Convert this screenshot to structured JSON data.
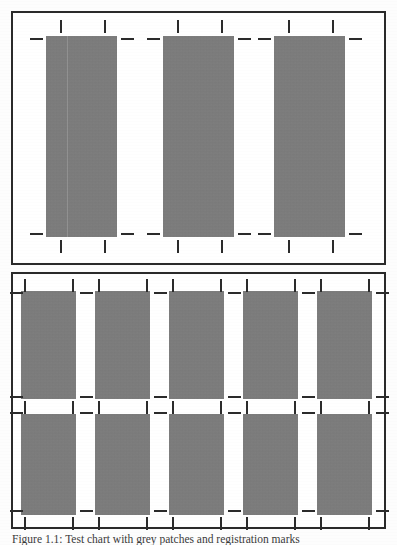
{
  "document": {
    "type": "scanned-figure",
    "page_background": "#fdfdfd",
    "caption": "Figure 1.1: Test chart with grey patches and registration marks",
    "caption_visible": "partially cropped at page bottom edge"
  },
  "colors": {
    "patch_gray": "#7c7c7c",
    "ink_black": "#2b2b2b",
    "border": "#2a2a2a",
    "paper": "#ffffff"
  },
  "panels": [
    {
      "id": "panel-top",
      "name": "upper-panel",
      "label": "Upper panel",
      "frame": {
        "x": 11,
        "y": 11,
        "w": 375,
        "h": 254
      },
      "column_count": 3,
      "row_count": 1,
      "blocks": [
        {
          "id": "t1",
          "x": 44,
          "y": 34,
          "w": 71,
          "h": 201,
          "seam": true
        },
        {
          "id": "t2",
          "x": 161,
          "y": 34,
          "w": 71,
          "h": 201,
          "seam": false
        },
        {
          "id": "t3",
          "x": 272,
          "y": 34,
          "w": 71,
          "h": 201,
          "seam": false
        }
      ],
      "ticks_vertical_top": [
        {
          "x": 58,
          "y": 18
        },
        {
          "x": 102,
          "y": 18
        },
        {
          "x": 175,
          "y": 18
        },
        {
          "x": 219,
          "y": 18
        },
        {
          "x": 286,
          "y": 18
        },
        {
          "x": 330,
          "y": 18
        }
      ],
      "ticks_vertical_bottom": [
        {
          "x": 58,
          "y": 238
        },
        {
          "x": 102,
          "y": 238
        },
        {
          "x": 175,
          "y": 238
        },
        {
          "x": 219,
          "y": 238
        },
        {
          "x": 286,
          "y": 238
        },
        {
          "x": 330,
          "y": 238
        }
      ],
      "ticks_horizontal_upper": [
        {
          "x": 28,
          "y": 36
        },
        {
          "x": 119,
          "y": 36
        },
        {
          "x": 145,
          "y": 36
        },
        {
          "x": 236,
          "y": 36
        },
        {
          "x": 256,
          "y": 36
        },
        {
          "x": 347,
          "y": 36
        }
      ],
      "ticks_horizontal_lower": [
        {
          "x": 28,
          "y": 231
        },
        {
          "x": 119,
          "y": 231
        },
        {
          "x": 145,
          "y": 231
        },
        {
          "x": 236,
          "y": 231
        },
        {
          "x": 256,
          "y": 231
        },
        {
          "x": 347,
          "y": 231
        }
      ]
    },
    {
      "id": "panel-bottom",
      "name": "lower-panel",
      "label": "Lower panel",
      "frame": {
        "x": 11,
        "y": 272,
        "w": 375,
        "h": 257
      },
      "column_count": 5,
      "row_count": 2,
      "blocks": [
        {
          "id": "b-r1c1",
          "x": 19,
          "y": 289,
          "w": 55,
          "h": 108
        },
        {
          "id": "b-r1c2",
          "x": 93,
          "y": 289,
          "w": 55,
          "h": 108
        },
        {
          "id": "b-r1c3",
          "x": 167,
          "y": 289,
          "w": 55,
          "h": 108
        },
        {
          "id": "b-r1c4",
          "x": 241,
          "y": 289,
          "w": 55,
          "h": 108
        },
        {
          "id": "b-r1c5",
          "x": 315,
          "y": 289,
          "w": 55,
          "h": 108
        },
        {
          "id": "b-r2c1",
          "x": 19,
          "y": 412,
          "w": 55,
          "h": 101
        },
        {
          "id": "b-r2c2",
          "x": 93,
          "y": 412,
          "w": 55,
          "h": 101
        },
        {
          "id": "b-r2c3",
          "x": 167,
          "y": 412,
          "w": 55,
          "h": 101
        },
        {
          "id": "b-r2c4",
          "x": 241,
          "y": 412,
          "w": 55,
          "h": 101
        },
        {
          "id": "b-r2c5",
          "x": 315,
          "y": 412,
          "w": 55,
          "h": 101
        }
      ],
      "ticks_vertical_top": [
        {
          "x": 22,
          "y": 277
        },
        {
          "x": 70,
          "y": 277
        },
        {
          "x": 96,
          "y": 277
        },
        {
          "x": 144,
          "y": 277
        },
        {
          "x": 170,
          "y": 277
        },
        {
          "x": 218,
          "y": 277
        },
        {
          "x": 244,
          "y": 277
        },
        {
          "x": 292,
          "y": 277
        },
        {
          "x": 318,
          "y": 277
        },
        {
          "x": 366,
          "y": 277
        }
      ],
      "ticks_vertical_middle": [
        {
          "x": 22,
          "y": 399
        },
        {
          "x": 70,
          "y": 399
        },
        {
          "x": 96,
          "y": 399
        },
        {
          "x": 144,
          "y": 399
        },
        {
          "x": 170,
          "y": 399
        },
        {
          "x": 218,
          "y": 399
        },
        {
          "x": 244,
          "y": 399
        },
        {
          "x": 292,
          "y": 399
        },
        {
          "x": 318,
          "y": 399
        },
        {
          "x": 366,
          "y": 399
        }
      ],
      "ticks_vertical_bottom": [
        {
          "x": 22,
          "y": 515
        },
        {
          "x": 70,
          "y": 515
        },
        {
          "x": 96,
          "y": 515
        },
        {
          "x": 144,
          "y": 515
        },
        {
          "x": 170,
          "y": 515
        },
        {
          "x": 218,
          "y": 515
        },
        {
          "x": 244,
          "y": 515
        },
        {
          "x": 292,
          "y": 515
        },
        {
          "x": 318,
          "y": 515
        },
        {
          "x": 366,
          "y": 515
        }
      ],
      "ticks_horizontal_row1_top": [
        {
          "x": 8,
          "y": 290
        },
        {
          "x": 78,
          "y": 290
        },
        {
          "x": 152,
          "y": 290
        },
        {
          "x": 226,
          "y": 290
        },
        {
          "x": 300,
          "y": 290
        },
        {
          "x": 374,
          "y": 290
        }
      ],
      "ticks_horizontal_row1_bottom": [
        {
          "x": 8,
          "y": 394
        },
        {
          "x": 78,
          "y": 394
        },
        {
          "x": 152,
          "y": 394
        },
        {
          "x": 226,
          "y": 394
        },
        {
          "x": 300,
          "y": 394
        },
        {
          "x": 374,
          "y": 394
        }
      ],
      "ticks_horizontal_row2_top": [
        {
          "x": 8,
          "y": 410
        },
        {
          "x": 78,
          "y": 410
        },
        {
          "x": 152,
          "y": 410
        },
        {
          "x": 226,
          "y": 410
        },
        {
          "x": 300,
          "y": 410
        },
        {
          "x": 374,
          "y": 410
        }
      ],
      "ticks_horizontal_row2_bottom": [
        {
          "x": 8,
          "y": 508
        },
        {
          "x": 78,
          "y": 508
        },
        {
          "x": 152,
          "y": 508
        },
        {
          "x": 226,
          "y": 508
        },
        {
          "x": 300,
          "y": 508
        },
        {
          "x": 374,
          "y": 508
        }
      ]
    }
  ]
}
